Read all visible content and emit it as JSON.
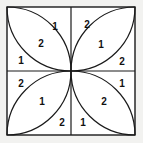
{
  "figure": {
    "canvas": {
      "width": 143,
      "height": 143,
      "background": "#f2f2f0"
    },
    "square": {
      "x": 7,
      "y": 7,
      "size": 128,
      "fill": "#ffffff",
      "stroke": "#1a1a1a",
      "stroke_width": 1.4
    },
    "divider": {
      "stroke": "#1a1a1a",
      "stroke_width": 1.2,
      "center_x": 71,
      "center_y": 71
    },
    "petal": {
      "stroke": "#1a1a1a",
      "stroke_width": 1.2,
      "arc_radius": 64,
      "count": 4
    },
    "quadrants": [
      {
        "name": "top-left",
        "petal_axis": "corner-to-center",
        "labels": [
          {
            "id": "tl-outer",
            "text": "1",
            "x": 55,
            "y": 26,
            "role": "outer-corner-region"
          },
          {
            "id": "tl-petal",
            "text": "2",
            "x": 41,
            "y": 43,
            "role": "petal-interior"
          },
          {
            "id": "tl-inner",
            "text": "1",
            "x": 21,
            "y": 60,
            "role": "outer-corner-region"
          }
        ]
      },
      {
        "name": "top-right",
        "petal_axis": "corner-to-center",
        "labels": [
          {
            "id": "tr-outer",
            "text": "2",
            "x": 87,
            "y": 24,
            "role": "outer-corner-region"
          },
          {
            "id": "tr-petal",
            "text": "1",
            "x": 101,
            "y": 44,
            "role": "petal-interior"
          },
          {
            "id": "tr-inner",
            "text": "2",
            "x": 122,
            "y": 61,
            "role": "outer-corner-region"
          }
        ]
      },
      {
        "name": "bottom-left",
        "petal_axis": "corner-to-center",
        "labels": [
          {
            "id": "bl-outer",
            "text": "2",
            "x": 21,
            "y": 83,
            "role": "outer-corner-region"
          },
          {
            "id": "bl-petal",
            "text": "1",
            "x": 42,
            "y": 101,
            "role": "petal-interior"
          },
          {
            "id": "bl-inner",
            "text": "2",
            "x": 62,
            "y": 122,
            "role": "outer-corner-region"
          }
        ]
      },
      {
        "name": "bottom-right",
        "petal_axis": "corner-to-center",
        "labels": [
          {
            "id": "br-outer",
            "text": "1",
            "x": 122,
            "y": 83,
            "role": "outer-corner-region"
          },
          {
            "id": "br-petal",
            "text": "2",
            "x": 104,
            "y": 101,
            "role": "petal-interior"
          },
          {
            "id": "br-inner",
            "text": "1",
            "x": 83,
            "y": 122,
            "role": "outer-corner-region"
          }
        ]
      }
    ],
    "all_label_values": [
      "1",
      "2",
      "1",
      "2",
      "1",
      "2",
      "2",
      "1",
      "2",
      "1",
      "2",
      "1"
    ]
  }
}
